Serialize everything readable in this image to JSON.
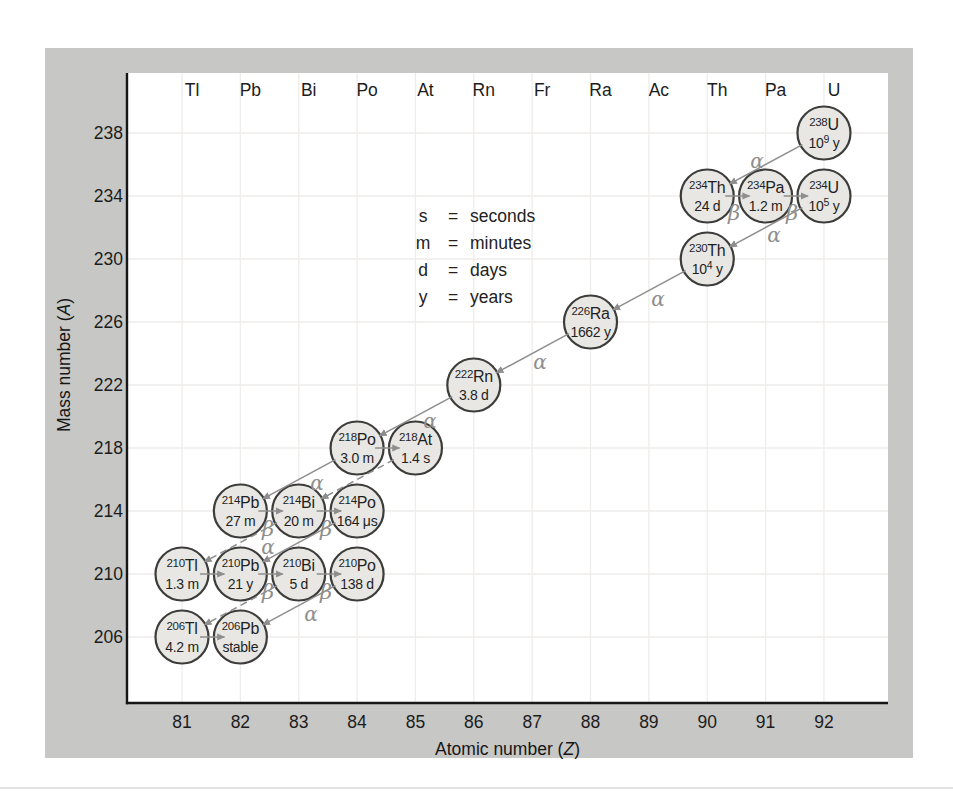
{
  "chart_data": {
    "type": "scatter",
    "x_axis": {
      "title_pre": "Atomic number (",
      "title_var": "Z",
      "title_post": ")",
      "ticks": [
        81,
        82,
        83,
        84,
        85,
        86,
        87,
        88,
        89,
        90,
        91,
        92
      ]
    },
    "y_axis": {
      "title_pre": "Mass number (",
      "title_var": "A",
      "title_post": ")",
      "ticks": [
        238,
        234,
        230,
        226,
        222,
        218,
        214,
        210,
        206
      ]
    },
    "element_symbols": [
      "Tl",
      "Pb",
      "Bi",
      "Po",
      "At",
      "Rn",
      "Fr",
      "Ra",
      "Ac",
      "Th",
      "Pa",
      "U"
    ],
    "legend_units": {
      "equals": "=",
      "rows": [
        {
          "symbol": "s",
          "word": "seconds"
        },
        {
          "symbol": "m",
          "word": "minutes"
        },
        {
          "symbol": "d",
          "word": "days"
        },
        {
          "symbol": "y",
          "word": "years"
        }
      ]
    },
    "nuclides": [
      {
        "id": "238U",
        "z": 92,
        "a": 238,
        "mass": "238",
        "symbol": "U",
        "hl": [
          "10",
          "9",
          " y"
        ]
      },
      {
        "id": "234Th",
        "z": 90,
        "a": 234,
        "mass": "234",
        "symbol": "Th",
        "hl": [
          "24 d",
          "",
          ""
        ]
      },
      {
        "id": "234Pa",
        "z": 91,
        "a": 234,
        "mass": "234",
        "symbol": "Pa",
        "hl": [
          "1.2 m",
          "",
          ""
        ]
      },
      {
        "id": "234U",
        "z": 92,
        "a": 234,
        "mass": "234",
        "symbol": "U",
        "hl": [
          "10",
          "5",
          " y"
        ]
      },
      {
        "id": "230Th",
        "z": 90,
        "a": 230,
        "mass": "230",
        "symbol": "Th",
        "hl": [
          "10",
          "4",
          " y"
        ]
      },
      {
        "id": "226Ra",
        "z": 88,
        "a": 226,
        "mass": "226",
        "symbol": "Ra",
        "hl": [
          "1662 y",
          "",
          ""
        ]
      },
      {
        "id": "222Rn",
        "z": 86,
        "a": 222,
        "mass": "222",
        "symbol": "Rn",
        "hl": [
          "3.8 d",
          "",
          ""
        ]
      },
      {
        "id": "218Po",
        "z": 84,
        "a": 218,
        "mass": "218",
        "symbol": "Po",
        "hl": [
          "3.0 m",
          "",
          ""
        ]
      },
      {
        "id": "218At",
        "z": 85,
        "a": 218,
        "mass": "218",
        "symbol": "At",
        "hl": [
          "1.4 s",
          "",
          ""
        ]
      },
      {
        "id": "214Pb",
        "z": 82,
        "a": 214,
        "mass": "214",
        "symbol": "Pb",
        "hl": [
          "27 m",
          "",
          ""
        ]
      },
      {
        "id": "214Bi",
        "z": 83,
        "a": 214,
        "mass": "214",
        "symbol": "Bi",
        "hl": [
          "20 m",
          "",
          ""
        ]
      },
      {
        "id": "214Po",
        "z": 84,
        "a": 214,
        "mass": "214",
        "symbol": "Po",
        "hl": [
          "164 μs",
          "",
          ""
        ]
      },
      {
        "id": "210Tl",
        "z": 81,
        "a": 210,
        "mass": "210",
        "symbol": "Tl",
        "hl": [
          "1.3 m",
          "",
          ""
        ]
      },
      {
        "id": "210Pb",
        "z": 82,
        "a": 210,
        "mass": "210",
        "symbol": "Pb",
        "hl": [
          "21 y",
          "",
          ""
        ]
      },
      {
        "id": "210Bi",
        "z": 83,
        "a": 210,
        "mass": "210",
        "symbol": "Bi",
        "hl": [
          "5 d",
          "",
          ""
        ]
      },
      {
        "id": "210Po",
        "z": 84,
        "a": 210,
        "mass": "210",
        "symbol": "Po",
        "hl": [
          "138 d",
          "",
          ""
        ]
      },
      {
        "id": "206Tl",
        "z": 81,
        "a": 206,
        "mass": "206",
        "symbol": "Tl",
        "hl": [
          "4.2 m",
          "",
          ""
        ]
      },
      {
        "id": "206Pb",
        "z": 82,
        "a": 206,
        "mass": "206",
        "symbol": "Pb",
        "hl": [
          "stable",
          "",
          ""
        ]
      }
    ],
    "decays": [
      {
        "from": "238U",
        "to": "234Th",
        "type": "alpha",
        "style": "solid",
        "label": "α",
        "lx": 757,
        "ly": 168
      },
      {
        "from": "234Th",
        "to": "234Pa",
        "type": "beta",
        "style": "solid",
        "label": "β",
        "lx": 734,
        "ly": 220
      },
      {
        "from": "234Pa",
        "to": "234U",
        "type": "beta",
        "style": "solid",
        "label": "β",
        "lx": 792,
        "ly": 220
      },
      {
        "from": "234U",
        "to": "230Th",
        "type": "alpha",
        "style": "solid",
        "label": "α",
        "lx": 774,
        "ly": 242
      },
      {
        "from": "230Th",
        "to": "226Ra",
        "type": "alpha",
        "style": "solid",
        "label": "α",
        "lx": 658,
        "ly": 306
      },
      {
        "from": "226Ra",
        "to": "222Rn",
        "type": "alpha",
        "style": "solid",
        "label": "α",
        "lx": 540,
        "ly": 369
      },
      {
        "from": "222Rn",
        "to": "218Po",
        "type": "alpha",
        "style": "solid",
        "label": "α",
        "lx": 430,
        "ly": 428
      },
      {
        "from": "218Po",
        "to": "218At",
        "type": "beta",
        "style": "solid",
        "label": "",
        "lx": 0,
        "ly": 0
      },
      {
        "from": "218Po",
        "to": "214Pb",
        "type": "alpha",
        "style": "solid",
        "label": "α",
        "lx": 317,
        "ly": 490
      },
      {
        "from": "218At",
        "to": "214Bi",
        "type": "alpha",
        "style": "dashed",
        "label": "",
        "lx": 0,
        "ly": 0
      },
      {
        "from": "214Pb",
        "to": "214Bi",
        "type": "beta",
        "style": "solid",
        "label": "β",
        "lx": 268,
        "ly": 536
      },
      {
        "from": "214Bi",
        "to": "214Po",
        "type": "beta",
        "style": "solid",
        "label": "β",
        "lx": 326,
        "ly": 536
      },
      {
        "from": "214Po",
        "to": "210Pb",
        "type": "alpha",
        "style": "solid",
        "label": "α",
        "lx": 268,
        "ly": 554
      },
      {
        "from": "214Bi",
        "to": "210Tl",
        "type": "alpha",
        "style": "dashed",
        "label": "",
        "lx": 0,
        "ly": 0
      },
      {
        "from": "210Tl",
        "to": "210Pb",
        "type": "beta",
        "style": "solid",
        "label": "",
        "lx": 0,
        "ly": 0
      },
      {
        "from": "210Pb",
        "to": "210Bi",
        "type": "beta",
        "style": "solid",
        "label": "β",
        "lx": 268,
        "ly": 599
      },
      {
        "from": "210Bi",
        "to": "210Po",
        "type": "beta",
        "style": "solid",
        "label": "β",
        "lx": 326,
        "ly": 599
      },
      {
        "from": "210Po",
        "to": "206Pb",
        "type": "alpha",
        "style": "solid",
        "label": "α",
        "lx": 311,
        "ly": 621
      },
      {
        "from": "210Bi",
        "to": "206Tl",
        "type": "alpha",
        "style": "dashed",
        "label": "",
        "lx": 0,
        "ly": 0
      },
      {
        "from": "206Tl",
        "to": "206Pb",
        "type": "beta",
        "style": "solid",
        "label": "",
        "lx": 0,
        "ly": 0
      }
    ],
    "colors": {
      "panel_background": "#c7c7c5",
      "plot_background": "#ffffff",
      "circle_fill": "#e8e7e4",
      "circle_stroke": "#3c3c3a",
      "arrow_gray": "#8e8e8e",
      "grid": "#efedea",
      "text": "#1c1c1c"
    }
  }
}
